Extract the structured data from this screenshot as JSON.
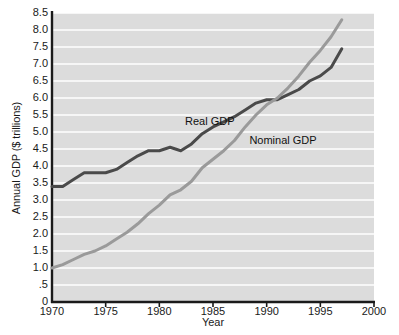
{
  "chart_data": {
    "type": "line",
    "title": "",
    "xlabel": "Year",
    "ylabel": "Annual GDP ($ trillions)",
    "xlim": [
      1970,
      2000
    ],
    "ylim": [
      0,
      8.5
    ],
    "grid": true,
    "legend_position": "inline-annotations",
    "x_ticks": [
      "1970",
      "1975",
      "1980",
      "1985",
      "1990",
      "1995",
      "2000"
    ],
    "x_tick_values": [
      1970,
      1975,
      1980,
      1985,
      1990,
      1995,
      2000
    ],
    "y_ticks": [
      "0",
      ".5",
      "1.0",
      "1.5",
      "2.0",
      "2.5",
      "3.0",
      "3.5",
      "4.0",
      "4.5",
      "5.0",
      "5.5",
      "6.0",
      "6.5",
      "7.0",
      "7.5",
      "8.0",
      "8.5"
    ],
    "y_tick_values": [
      0,
      0.5,
      1.0,
      1.5,
      2.0,
      2.5,
      3.0,
      3.5,
      4.0,
      4.5,
      5.0,
      5.5,
      6.0,
      6.5,
      7.0,
      7.5,
      8.0,
      8.5
    ],
    "x": [
      1970,
      1971,
      1972,
      1973,
      1974,
      1975,
      1976,
      1977,
      1978,
      1979,
      1980,
      1981,
      1982,
      1983,
      1984,
      1985,
      1986,
      1987,
      1988,
      1989,
      1990,
      1991,
      1992,
      1993,
      1994,
      1995,
      1996,
      1997
    ],
    "series": [
      {
        "name": "Real GDP",
        "color": "#4a4a4a",
        "label_x": 1985,
        "label_y": 5.3,
        "values": [
          3.4,
          3.4,
          3.6,
          3.8,
          3.8,
          3.8,
          3.9,
          4.1,
          4.3,
          4.45,
          4.45,
          4.55,
          4.45,
          4.65,
          4.95,
          5.15,
          5.3,
          5.45,
          5.65,
          5.85,
          5.95,
          5.95,
          6.1,
          6.25,
          6.5,
          6.65,
          6.9,
          7.45
        ]
      },
      {
        "name": "Nominal GDP",
        "color": "#9a9a9a",
        "label_x": 1991,
        "label_y": 4.75,
        "values": [
          1.0,
          1.1,
          1.25,
          1.4,
          1.5,
          1.65,
          1.85,
          2.05,
          2.3,
          2.6,
          2.85,
          3.15,
          3.3,
          3.55,
          3.95,
          4.2,
          4.45,
          4.75,
          5.15,
          5.5,
          5.8,
          6.0,
          6.3,
          6.65,
          7.05,
          7.4,
          7.8,
          8.3
        ]
      }
    ]
  },
  "axes": {
    "y_title": "Annual GDP ($ trillions)",
    "x_title": "Year"
  },
  "colors": {
    "plot_background": "#dcdcdc",
    "gridline": "#ffffff",
    "axis": "#1a1a1a",
    "real_gdp": "#4a4a4a",
    "nominal_gdp": "#9a9a9a"
  }
}
